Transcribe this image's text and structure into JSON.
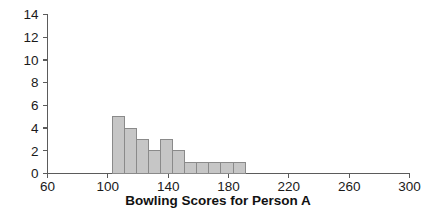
{
  "chart_data": {
    "type": "bar",
    "title": "",
    "xlabel": "Bowling Scores for Person A",
    "ylabel": "",
    "xlim": [
      60,
      300
    ],
    "ylim": [
      0,
      14
    ],
    "grid": false,
    "legend": null,
    "bin_width": 8,
    "bin_starts": [
      103,
      111,
      119,
      127,
      135,
      143,
      151,
      159,
      167,
      175,
      183
    ],
    "categories": [
      "103-111",
      "111-119",
      "119-127",
      "127-135",
      "135-143",
      "143-151",
      "151-159",
      "159-167",
      "167-175",
      "175-183",
      "183-191"
    ],
    "values": [
      5,
      4,
      3,
      2,
      3,
      2,
      1,
      1,
      1,
      1,
      1
    ],
    "xticks": [
      60,
      100,
      140,
      180,
      220,
      260,
      300
    ],
    "xtick_labels": [
      "60",
      "100",
      "140",
      "180",
      "220",
      "260",
      "300"
    ],
    "yticks": [
      0,
      2,
      4,
      6,
      8,
      10,
      12,
      14
    ],
    "ytick_labels": [
      "0",
      "2",
      "4",
      "6",
      "8",
      "10",
      "12",
      "14"
    ],
    "bar_color": "#c6c6c6",
    "bar_edge_color": "#8a8a8a",
    "axis_color": "#5b5b5b",
    "text_color": "#1a1a1a"
  },
  "figure": {
    "background": "#ffffff",
    "xaxis_title": "Bowling Scores for Person A"
  }
}
